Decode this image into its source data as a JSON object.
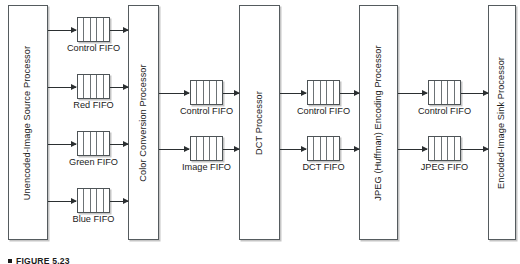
{
  "figure": {
    "caption": "FIGURE 5.23",
    "caption_marker": "square-bullet"
  },
  "processors": [
    {
      "id": "unencoded-image-source-processor",
      "label": "Unencoded-Image Source Processor",
      "x": 8,
      "y": 5,
      "w": 40,
      "h": 235
    },
    {
      "id": "color-conversion-processor",
      "label": "Color Conversion Processor",
      "x": 128,
      "y": 5,
      "w": 31,
      "h": 235
    },
    {
      "id": "dct-processor",
      "label": "DCT Processor",
      "x": 239,
      "y": 5,
      "w": 41,
      "h": 235
    },
    {
      "id": "jpeg-huffman-encoding-processor",
      "label": "JPEG (Huffman) Encoding Processor",
      "x": 359,
      "y": 5,
      "w": 39,
      "h": 235
    },
    {
      "id": "encoded-image-sink-processor",
      "label": "Encoded-Image Sink Processor",
      "x": 488,
      "y": 5,
      "w": 28,
      "h": 235
    }
  ],
  "fifos": [
    {
      "id": "fifo-control-1",
      "label": "Control FIFO",
      "x": 77,
      "y": 17,
      "w": 33,
      "h": 25,
      "cells": 5,
      "label_y": 44
    },
    {
      "id": "fifo-red",
      "label": "Red FIFO",
      "x": 77,
      "y": 74,
      "w": 33,
      "h": 25,
      "cells": 5,
      "label_y": 101
    },
    {
      "id": "fifo-green",
      "label": "Green FIFO",
      "x": 77,
      "y": 131,
      "w": 33,
      "h": 25,
      "cells": 5,
      "label_y": 158
    },
    {
      "id": "fifo-blue",
      "label": "Blue FIFO",
      "x": 77,
      "y": 188,
      "w": 33,
      "h": 25,
      "cells": 5,
      "label_y": 215
    },
    {
      "id": "fifo-control-2",
      "label": "Control FIFO",
      "x": 190,
      "y": 80,
      "w": 33,
      "h": 25,
      "cells": 5,
      "label_y": 107
    },
    {
      "id": "fifo-image",
      "label": "Image FIFO",
      "x": 190,
      "y": 136,
      "w": 33,
      "h": 25,
      "cells": 5,
      "label_y": 163
    },
    {
      "id": "fifo-control-3",
      "label": "Control FIFO",
      "x": 307,
      "y": 80,
      "w": 33,
      "h": 25,
      "cells": 5,
      "label_y": 107
    },
    {
      "id": "fifo-dct",
      "label": "DCT FIFO",
      "x": 307,
      "y": 136,
      "w": 33,
      "h": 25,
      "cells": 5,
      "label_y": 163
    },
    {
      "id": "fifo-control-4",
      "label": "Control FIFO",
      "x": 428,
      "y": 80,
      "w": 33,
      "h": 25,
      "cells": 5,
      "label_y": 107
    },
    {
      "id": "fifo-jpeg",
      "label": "JPEG FIFO",
      "x": 428,
      "y": 136,
      "w": 33,
      "h": 25,
      "cells": 5,
      "label_y": 163
    }
  ],
  "arrows": [
    {
      "id": "arrow-src-to-control1",
      "x": 48,
      "y": 30,
      "len": 28
    },
    {
      "id": "arrow-control1-to-ccp",
      "x": 110,
      "y": 30,
      "len": 18
    },
    {
      "id": "arrow-src-to-red",
      "x": 48,
      "y": 87,
      "len": 28
    },
    {
      "id": "arrow-red-to-ccp",
      "x": 110,
      "y": 87,
      "len": 18
    },
    {
      "id": "arrow-src-to-green",
      "x": 48,
      "y": 144,
      "len": 28
    },
    {
      "id": "arrow-green-to-ccp",
      "x": 110,
      "y": 144,
      "len": 18
    },
    {
      "id": "arrow-src-to-blue",
      "x": 48,
      "y": 201,
      "len": 28
    },
    {
      "id": "arrow-blue-to-ccp",
      "x": 110,
      "y": 201,
      "len": 18
    },
    {
      "id": "arrow-ccp-to-control2",
      "x": 159,
      "y": 93,
      "len": 30
    },
    {
      "id": "arrow-control2-to-dct",
      "x": 223,
      "y": 93,
      "len": 16
    },
    {
      "id": "arrow-ccp-to-image",
      "x": 159,
      "y": 149,
      "len": 30
    },
    {
      "id": "arrow-image-to-dct",
      "x": 223,
      "y": 149,
      "len": 16
    },
    {
      "id": "arrow-dct-to-control3",
      "x": 280,
      "y": 93,
      "len": 26
    },
    {
      "id": "arrow-control3-to-jpeg",
      "x": 340,
      "y": 93,
      "len": 19
    },
    {
      "id": "arrow-dct-to-dctfifo",
      "x": 280,
      "y": 149,
      "len": 26
    },
    {
      "id": "arrow-dctfifo-to-jpeg",
      "x": 340,
      "y": 149,
      "len": 19
    },
    {
      "id": "arrow-jpeg-to-control4",
      "x": 398,
      "y": 93,
      "len": 29
    },
    {
      "id": "arrow-control4-to-sink",
      "x": 461,
      "y": 93,
      "len": 27
    },
    {
      "id": "arrow-jpeg-to-jpegfifo",
      "x": 398,
      "y": 149,
      "len": 29
    },
    {
      "id": "arrow-jpegfifo-to-sink",
      "x": 461,
      "y": 149,
      "len": 27
    }
  ]
}
